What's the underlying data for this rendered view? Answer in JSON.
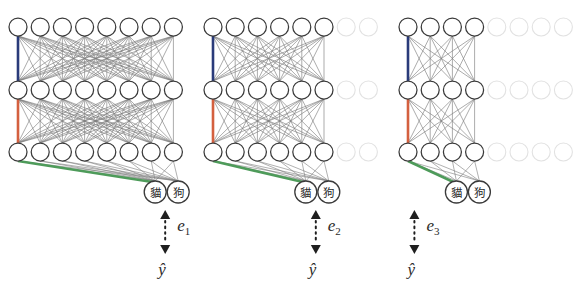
{
  "figure": {
    "type": "diagram",
    "background": "#ffffff",
    "panels": [
      {
        "id": "panel-1",
        "error_label": "e",
        "error_sub": "1",
        "output_label": "ŷ",
        "active_units_per_layer": 8,
        "ghost_units_per_layer": 0,
        "layers": 3,
        "origin_x": 18,
        "class_nodes": [
          {
            "text": "貓",
            "meaning": "cat"
          },
          {
            "text": "狗",
            "meaning": "dog"
          }
        ]
      },
      {
        "id": "panel-2",
        "error_label": "e",
        "error_sub": "2",
        "output_label": "ŷ",
        "active_units_per_layer": 6,
        "ghost_units_per_layer": 2,
        "layers": 3,
        "origin_x": 213,
        "class_nodes": [
          {
            "text": "貓",
            "meaning": "cat"
          },
          {
            "text": "狗",
            "meaning": "dog"
          }
        ]
      },
      {
        "id": "panel-3",
        "error_label": "e",
        "error_sub": "3",
        "output_label": "ŷ",
        "active_units_per_layer": 4,
        "ghost_units_per_layer": 4,
        "layers": 3,
        "origin_x": 408,
        "class_nodes": [
          {
            "text": "貓",
            "meaning": "cat"
          },
          {
            "text": "狗",
            "meaning": "dog"
          }
        ]
      }
    ],
    "colors": {
      "node_stroke": "#3a3a3a",
      "ghost_stroke": "#e2e2e2",
      "edge": "#7d7d7d",
      "highlight_top": "#2a3b7a",
      "highlight_mid": "#d4603f",
      "highlight_bottom": "#4e9b5a",
      "text": "#2b2b2b",
      "arrow": "#1f1f1f"
    },
    "geometry": {
      "node_radius": 9,
      "node_spacing": 22.2,
      "row_y": [
        27,
        90,
        152
      ],
      "class_node_radius": 11,
      "class_row_y": 192
    }
  }
}
